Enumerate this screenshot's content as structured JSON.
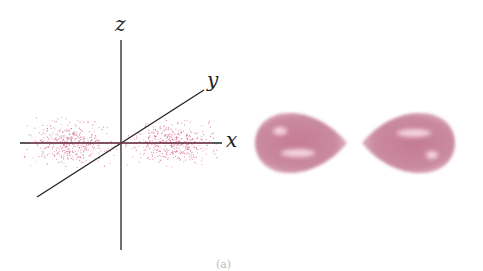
{
  "figure": {
    "panel_left": {
      "type": "probability-density dot plot",
      "axes": {
        "x_label": "x",
        "y_label": "y",
        "z_label": "z"
      },
      "dot_color": "#d2487a",
      "axis_color": "#222222"
    },
    "panel_right": {
      "type": "boundary-surface lobes",
      "lobe_color": "#d18aa0",
      "highlight_color": "#f3c4d2"
    },
    "caption": "(a)"
  }
}
